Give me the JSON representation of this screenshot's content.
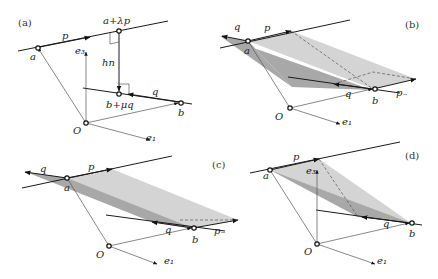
{
  "panels": [
    {
      "id": "a",
      "label": "(a)",
      "points": {
        "a": "a",
        "b": "b",
        "O": "O",
        "top": "a+λp",
        "bottom": "b+μq"
      },
      "vectors": {
        "p": "p",
        "q": "q",
        "e3": "e₃",
        "e1": "e₁",
        "hn": "hn"
      }
    },
    {
      "id": "b",
      "label": "(b)",
      "points": {
        "a": "a",
        "b": "b",
        "O": "O"
      },
      "vectors": {
        "p": "p",
        "q": "q",
        "q2": "q",
        "pminus": "p₋",
        "e1": "e₁"
      }
    },
    {
      "id": "c",
      "label": "(c)",
      "points": {
        "a": "a",
        "b": "b",
        "O": "O"
      },
      "vectors": {
        "p": "p",
        "q": "q",
        "q2": "q",
        "pminus": "p₋",
        "e1": "e₁"
      }
    },
    {
      "id": "d",
      "label": "(d)",
      "points": {
        "a": "a",
        "b": "b",
        "O": "O"
      },
      "vectors": {
        "p": "p",
        "q": "q",
        "e3": "e₃",
        "e1": "e₁"
      }
    }
  ],
  "colors": {
    "shade_light": "#d4d4d4",
    "shade_dark": "#a8a8a8",
    "line": "#1a1a1a"
  }
}
